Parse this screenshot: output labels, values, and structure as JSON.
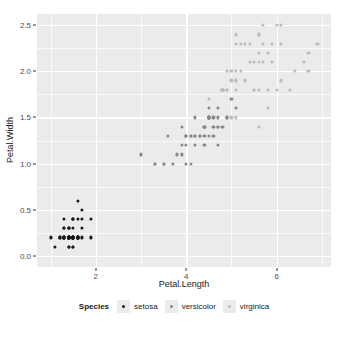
{
  "chart_data": {
    "type": "scatter",
    "title": "",
    "xlabel": "Petal.Length",
    "ylabel": "Petal.Width",
    "xlim": [
      0.7,
      7.2
    ],
    "ylim": [
      -0.12,
      2.62
    ],
    "xticks": [
      2,
      4,
      6
    ],
    "xtick_labels": [
      "2",
      "4",
      "6"
    ],
    "yticks": [
      0.0,
      0.5,
      1.0,
      1.5,
      2.0,
      2.5
    ],
    "ytick_labels": [
      "0.0",
      "0.5",
      "1.0",
      "1.5",
      "2.0",
      "2.5"
    ],
    "x_minor_ticks": [
      1,
      3,
      5,
      7
    ],
    "y_minor_ticks": [
      0.25,
      0.75,
      1.25,
      1.75,
      2.25
    ],
    "grid": true,
    "panel_background": "#ebebeb",
    "grid_color": "#ffffff",
    "legend_position": "bottom",
    "legend_title": "Species",
    "series": [
      {
        "name": "setosa",
        "color": "#1a1a1a",
        "points": [
          [
            1.4,
            0.2
          ],
          [
            1.4,
            0.2
          ],
          [
            1.3,
            0.2
          ],
          [
            1.5,
            0.2
          ],
          [
            1.4,
            0.2
          ],
          [
            1.7,
            0.4
          ],
          [
            1.4,
            0.3
          ],
          [
            1.5,
            0.2
          ],
          [
            1.4,
            0.2
          ],
          [
            1.5,
            0.1
          ],
          [
            1.5,
            0.2
          ],
          [
            1.6,
            0.2
          ],
          [
            1.4,
            0.1
          ],
          [
            1.1,
            0.1
          ],
          [
            1.2,
            0.2
          ],
          [
            1.5,
            0.4
          ],
          [
            1.3,
            0.4
          ],
          [
            1.4,
            0.3
          ],
          [
            1.7,
            0.3
          ],
          [
            1.5,
            0.3
          ],
          [
            1.7,
            0.2
          ],
          [
            1.5,
            0.4
          ],
          [
            1.0,
            0.2
          ],
          [
            1.7,
            0.5
          ],
          [
            1.9,
            0.2
          ],
          [
            1.6,
            0.2
          ],
          [
            1.6,
            0.4
          ],
          [
            1.5,
            0.2
          ],
          [
            1.4,
            0.2
          ],
          [
            1.6,
            0.2
          ],
          [
            1.6,
            0.2
          ],
          [
            1.5,
            0.4
          ],
          [
            1.5,
            0.1
          ],
          [
            1.4,
            0.2
          ],
          [
            1.5,
            0.2
          ],
          [
            1.2,
            0.2
          ],
          [
            1.3,
            0.2
          ],
          [
            1.4,
            0.1
          ],
          [
            1.3,
            0.2
          ],
          [
            1.5,
            0.2
          ],
          [
            1.3,
            0.3
          ],
          [
            1.3,
            0.3
          ],
          [
            1.3,
            0.2
          ],
          [
            1.6,
            0.6
          ],
          [
            1.9,
            0.4
          ],
          [
            1.4,
            0.3
          ],
          [
            1.6,
            0.2
          ],
          [
            1.4,
            0.2
          ],
          [
            1.5,
            0.2
          ],
          [
            1.4,
            0.2
          ]
        ]
      },
      {
        "name": "versicolor",
        "color": "#888888",
        "points": [
          [
            4.7,
            1.4
          ],
          [
            4.5,
            1.5
          ],
          [
            4.9,
            1.5
          ],
          [
            4.0,
            1.3
          ],
          [
            4.6,
            1.5
          ],
          [
            4.5,
            1.3
          ],
          [
            4.7,
            1.6
          ],
          [
            3.3,
            1.0
          ],
          [
            4.6,
            1.3
          ],
          [
            3.9,
            1.4
          ],
          [
            3.5,
            1.0
          ],
          [
            4.2,
            1.5
          ],
          [
            4.0,
            1.0
          ],
          [
            4.7,
            1.4
          ],
          [
            3.6,
            1.3
          ],
          [
            4.4,
            1.4
          ],
          [
            4.5,
            1.5
          ],
          [
            4.1,
            1.0
          ],
          [
            4.5,
            1.5
          ],
          [
            3.9,
            1.1
          ],
          [
            4.8,
            1.8
          ],
          [
            4.0,
            1.3
          ],
          [
            4.9,
            1.5
          ],
          [
            4.7,
            1.2
          ],
          [
            4.3,
            1.3
          ],
          [
            4.4,
            1.4
          ],
          [
            4.8,
            1.4
          ],
          [
            5.0,
            1.7
          ],
          [
            4.5,
            1.5
          ],
          [
            3.5,
            1.0
          ],
          [
            3.8,
            1.1
          ],
          [
            3.7,
            1.0
          ],
          [
            3.9,
            1.2
          ],
          [
            5.1,
            1.6
          ],
          [
            4.5,
            1.5
          ],
          [
            4.5,
            1.6
          ],
          [
            4.7,
            1.5
          ],
          [
            4.4,
            1.3
          ],
          [
            4.1,
            1.3
          ],
          [
            4.0,
            1.3
          ],
          [
            4.4,
            1.2
          ],
          [
            4.6,
            1.4
          ],
          [
            4.0,
            1.2
          ],
          [
            3.3,
            1.0
          ],
          [
            4.2,
            1.3
          ],
          [
            4.2,
            1.2
          ],
          [
            4.2,
            1.3
          ],
          [
            4.3,
            1.3
          ],
          [
            3.0,
            1.1
          ],
          [
            4.1,
            1.3
          ]
        ]
      },
      {
        "name": "virginica",
        "color": "#bcbcbc",
        "points": [
          [
            6.0,
            2.5
          ],
          [
            5.1,
            1.9
          ],
          [
            5.9,
            2.1
          ],
          [
            5.6,
            1.8
          ],
          [
            5.8,
            2.2
          ],
          [
            6.6,
            2.1
          ],
          [
            4.5,
            1.7
          ],
          [
            6.3,
            1.8
          ],
          [
            5.8,
            1.8
          ],
          [
            6.1,
            2.5
          ],
          [
            5.1,
            2.0
          ],
          [
            5.3,
            1.9
          ],
          [
            5.5,
            2.1
          ],
          [
            5.0,
            2.0
          ],
          [
            5.1,
            2.4
          ],
          [
            5.3,
            2.3
          ],
          [
            5.5,
            1.8
          ],
          [
            6.7,
            2.2
          ],
          [
            6.9,
            2.3
          ],
          [
            5.0,
            1.5
          ],
          [
            5.7,
            2.3
          ],
          [
            4.9,
            2.0
          ],
          [
            6.7,
            2.0
          ],
          [
            4.9,
            1.8
          ],
          [
            5.7,
            2.1
          ],
          [
            6.0,
            1.8
          ],
          [
            4.8,
            1.8
          ],
          [
            4.9,
            1.8
          ],
          [
            5.6,
            2.1
          ],
          [
            5.8,
            1.6
          ],
          [
            6.1,
            1.9
          ],
          [
            6.4,
            2.0
          ],
          [
            5.6,
            2.2
          ],
          [
            5.1,
            1.5
          ],
          [
            5.6,
            1.4
          ],
          [
            6.1,
            2.3
          ],
          [
            5.6,
            2.4
          ],
          [
            5.5,
            1.8
          ],
          [
            4.8,
            1.8
          ],
          [
            5.4,
            2.1
          ],
          [
            5.6,
            2.4
          ],
          [
            5.1,
            2.3
          ],
          [
            5.1,
            1.9
          ],
          [
            5.9,
            2.3
          ],
          [
            5.7,
            2.5
          ],
          [
            5.2,
            2.3
          ],
          [
            5.0,
            1.9
          ],
          [
            5.2,
            2.0
          ],
          [
            5.4,
            2.3
          ],
          [
            5.1,
            1.8
          ]
        ]
      }
    ]
  }
}
